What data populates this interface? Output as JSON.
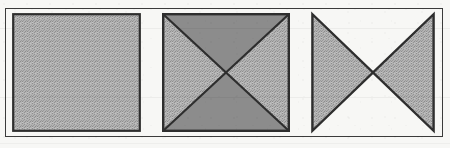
{
  "plate": {
    "background_color": "#f7f7f5",
    "frame": {
      "name": "figure-frame",
      "stroke_color": "#3b3b3b",
      "stroke_width": 1.4,
      "x": 5,
      "y": 8,
      "width": 438,
      "height": 129
    }
  },
  "palette": {
    "ink": "#2e2e2e",
    "fill_light_hatched": "#a9a9a9",
    "fill_medium_solid": "#8c8c8c",
    "fill_none": "#ffffff",
    "paper": "#f7f7f5"
  },
  "figures": [
    {
      "id": "figure-1",
      "label": "plain-shaded-square",
      "shape": "square",
      "diagonals": false,
      "regions": [
        {
          "name": "whole-square",
          "fill": "light-hatched"
        }
      ],
      "box": {
        "x": 12,
        "y": 13,
        "width": 129,
        "height": 119
      }
    },
    {
      "id": "figure-2",
      "label": "square-with-both-diagonals-all-four-triangles-shaded",
      "shape": "square",
      "diagonals": true,
      "regions": [
        {
          "name": "top-triangle",
          "fill": "medium-solid"
        },
        {
          "name": "right-triangle",
          "fill": "light-hatched"
        },
        {
          "name": "bottom-triangle",
          "fill": "medium-solid"
        },
        {
          "name": "left-triangle",
          "fill": "light-hatched"
        }
      ],
      "box": {
        "x": 162,
        "y": 13,
        "width": 128,
        "height": 119
      }
    },
    {
      "id": "figure-3",
      "label": "bowtie-hourglass-only-left-and-right-triangles-shaded",
      "shape": "bowtie",
      "diagonals": true,
      "regions": [
        {
          "name": "top-triangle",
          "fill": "none"
        },
        {
          "name": "right-triangle",
          "fill": "light-hatched"
        },
        {
          "name": "bottom-triangle",
          "fill": "none"
        },
        {
          "name": "left-triangle",
          "fill": "light-hatched"
        }
      ],
      "box": {
        "x": 311,
        "y": 13,
        "width": 124,
        "height": 119
      }
    }
  ],
  "captions": {
    "figure_1": "",
    "figure_2": "",
    "figure_3": ""
  }
}
